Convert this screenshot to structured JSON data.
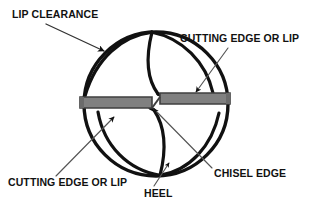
{
  "diagram": {
    "type": "technical-line-drawing",
    "canvas": {
      "width": 311,
      "height": 209
    },
    "colors": {
      "background": "#ffffff",
      "outline": "#111111",
      "lip_fill": "#808080",
      "lip_edge": "#4d4d4d",
      "leader_line": "#555555",
      "arrow_head": "#111111",
      "text": "#111111"
    },
    "labels": [
      {
        "id": "lip-clearance",
        "text": "LIP CLEARANCE",
        "x": 12,
        "y": 18,
        "anchor": "start",
        "leader": {
          "from_x": 46,
          "from_y": 24,
          "to_x": 106,
          "to_y": 53
        },
        "arrow": "solid"
      },
      {
        "id": "cutting-edge-top",
        "text": "CUTTING EDGE OR LIP",
        "x": 180,
        "y": 42,
        "anchor": "start",
        "leader": {
          "from_x": 228,
          "from_y": 48,
          "to_x": 194,
          "to_y": 94
        },
        "arrow": "solid"
      },
      {
        "id": "cutting-edge-bottom",
        "text": "CUTTING EDGE OR LIP",
        "x": 8,
        "y": 186,
        "anchor": "start",
        "leader": {
          "from_x": 56,
          "from_y": 176,
          "to_x": 116,
          "to_y": 118
        },
        "arrow": "solid"
      },
      {
        "id": "heel",
        "text": "HEEL",
        "x": 144,
        "y": 196,
        "anchor": "start",
        "leader": {
          "from_x": 154,
          "from_y": 186,
          "to_x": 168,
          "to_y": 164
        },
        "arrow": "solid"
      },
      {
        "id": "chisel-edge",
        "text": "CHISEL EDGE",
        "x": 214,
        "y": 176,
        "anchor": "start",
        "leader": {
          "from_x": 212,
          "from_y": 168,
          "to_x": 152,
          "to_y": 110
        },
        "arrow": "solid"
      }
    ],
    "geometry": {
      "body_circle": {
        "cx": 156,
        "cy": 104,
        "r": 72
      },
      "lip_bar_left": {
        "x": 80,
        "y": 97,
        "width": 78,
        "height": 11
      },
      "lip_bar_right": {
        "x": 156,
        "y": 93,
        "width": 74,
        "height": 11
      },
      "chisel_edge_segment": {
        "x1": 151,
        "y1": 109,
        "x2": 161,
        "y2": 99
      }
    }
  }
}
